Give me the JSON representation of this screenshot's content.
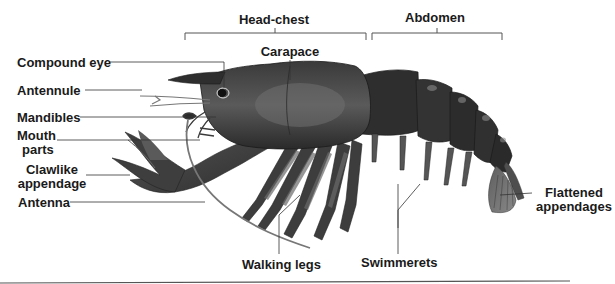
{
  "diagram": {
    "body_regions": [
      {
        "id": "head-chest",
        "label": "Head-chest"
      },
      {
        "id": "abdomen",
        "label": "Abdomen"
      }
    ],
    "labels": {
      "compound_eye": "Compound eye",
      "antennule": "Antennule",
      "mandibles": "Mandibles",
      "mouth_parts_line1": "Mouth",
      "mouth_parts_line2": "parts",
      "clawlike_line1": "Clawlike",
      "clawlike_line2": "appendage",
      "antenna": "Antenna",
      "carapace": "Carapace",
      "walking_legs": "Walking legs",
      "swimmerets": "Swimmerets",
      "flattened_line1": "Flattened",
      "flattened_line2": "appendages"
    },
    "colors": {
      "label_text": "#1a1a1a",
      "leader_line": "#333333",
      "body_dark": "#2b2b2b",
      "body_mid": "#4a4a4a",
      "body_light": "#6e6e6e",
      "highlight": "#9a9a9a",
      "divider": "#555555"
    }
  }
}
